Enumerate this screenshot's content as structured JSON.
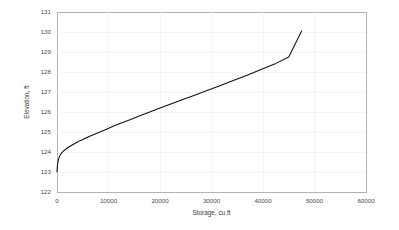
{
  "chart_data": {
    "type": "line",
    "title": "",
    "subtitle": "",
    "xlabel": "Storage, cu.ft",
    "ylabel": "Elevation, ft",
    "xlim": [
      0,
      60000
    ],
    "ylim": [
      122,
      131
    ],
    "xticks": [
      0,
      10000,
      20000,
      30000,
      40000,
      50000,
      60000
    ],
    "xtick_labels": [
      "0",
      "10000",
      "20000",
      "30000",
      "40000",
      "50000",
      "60000"
    ],
    "yticks": [
      122,
      123,
      124,
      125,
      126,
      127,
      128,
      129,
      130,
      131
    ],
    "ytick_labels": [
      "122",
      "123",
      "124",
      "125",
      "126",
      "127",
      "128",
      "129",
      "130",
      "131"
    ],
    "grid": true,
    "grid_color": "#e9eef2",
    "legend": null,
    "legend_position": "none",
    "series": [
      {
        "name": "Storage-Elevation curve",
        "color": "#101010",
        "line_width": 1.05,
        "x": [
          0,
          40,
          110,
          220,
          400,
          650,
          950,
          1300,
          1750,
          2300,
          2950,
          3700,
          4600,
          5600,
          6800,
          8100,
          9500,
          11000,
          12600,
          14300,
          16100,
          18000,
          20000,
          22100,
          24300,
          26600,
          29000,
          31500,
          34100,
          36800,
          39600,
          42500,
          45000,
          47500
        ],
        "y": [
          123.0,
          123.18,
          123.38,
          123.56,
          123.72,
          123.86,
          123.97,
          124.06,
          124.15,
          124.25,
          124.35,
          124.46,
          124.58,
          124.7,
          124.84,
          124.98,
          125.13,
          125.3,
          125.46,
          125.63,
          125.81,
          126.0,
          126.2,
          126.4,
          126.61,
          126.83,
          127.06,
          127.3,
          127.56,
          127.83,
          128.12,
          128.43,
          128.75,
          130.05
        ]
      }
    ],
    "annotations": []
  },
  "axes": {
    "x_title": "Storage, cu.ft",
    "y_title": "Elevation, ft"
  },
  "colors": {
    "background": "#ffffff",
    "plot_background": "#ffffff",
    "frame": "#9aa0a6",
    "grid": "#e9eef2",
    "series": "#101010",
    "tick_text": "#4a4a4a",
    "title_text": "#3b3b3b"
  }
}
